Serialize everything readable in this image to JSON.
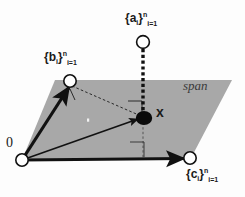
{
  "figure": {
    "background_color": "#fdfdfd",
    "plane_fill_color": "#a8a8a8",
    "stroke_color": "#111111",
    "labels": {
      "origin": "0",
      "span": "span",
      "projection_point": "x",
      "set_a": {
        "open": "{",
        "base": "a",
        "subscript": "i",
        "close": "}",
        "superscript": "n",
        "lower_index": "i=1"
      },
      "set_b": {
        "open": "{",
        "base": "b",
        "subscript": "i",
        "close": "}",
        "superscript": "n",
        "lower_index": "i=1"
      },
      "set_c": {
        "open": "{",
        "base": "c",
        "subscript": "i",
        "close": "}",
        "superscript": "n",
        "lower_index": "i=1"
      }
    },
    "geometry": {
      "plane_points": "55,80 232,80 190,160 22,160",
      "origin": {
        "x": 22,
        "y": 160
      },
      "vector_b_tip": {
        "x": 70,
        "y": 81
      },
      "vector_c_tip": {
        "x": 190,
        "y": 158
      },
      "vector_a_tip": {
        "x": 143,
        "y": 42
      },
      "point_x": {
        "x": 143,
        "y": 118
      },
      "speck": {
        "x": 88,
        "y": 120
      }
    }
  }
}
